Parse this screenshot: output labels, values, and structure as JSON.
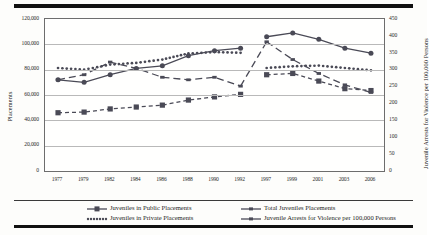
{
  "chart_data": {
    "type": "line",
    "title": "",
    "xlabel": "",
    "ylabel": "Placements",
    "ylabel_right": "Juvenile Arrests for Violence per 100,000 Persons",
    "grid": true,
    "legend_position": "bottom",
    "categories": [
      "1977",
      "1979",
      "1982",
      "1984",
      "1986",
      "1988",
      "1990",
      "1992",
      "1997",
      "1999",
      "2001",
      "2003",
      "2006"
    ],
    "ylim": [
      0,
      120000
    ],
    "yticks": [
      "0",
      "20,000",
      "40,000",
      "60,000",
      "80,000",
      "100,000",
      "120,000"
    ],
    "ylim_right": [
      0,
      450
    ],
    "yticks_right": [
      "0",
      "50",
      "100",
      "150",
      "200",
      "250",
      "300",
      "350",
      "400",
      "450"
    ],
    "series": [
      {
        "name": "Juveniles in Public Placements",
        "axis": "left",
        "values": [
          72000,
          70000,
          76000,
          81000,
          83000,
          91000,
          95000,
          97000,
          106000,
          109000,
          104000,
          97000,
          93000
        ]
      },
      {
        "name": "Juveniles in Private Placements",
        "axis": "left",
        "values": [
          46000,
          46500,
          49000,
          50500,
          52000,
          56000,
          58500,
          60500,
          76000,
          77000,
          71000,
          65000,
          63500
        ]
      },
      {
        "name": "Total Juveniles Placements",
        "axis": "left",
        "values": [
          72000,
          76000,
          86000,
          81000,
          74000,
          72000,
          74000,
          67000,
          102000,
          88000,
          77000,
          68000,
          62000
        ]
      },
      {
        "name": "Juvenile Arrests for Violence per 100,000 Persons",
        "axis": "right",
        "values": [
          305,
          300,
          315,
          320,
          330,
          348,
          352,
          350,
          305,
          310,
          312,
          305,
          298
        ]
      }
    ],
    "legend": [
      {
        "label": "Juveniles in Public Placements",
        "style": "solid-circle"
      },
      {
        "label": "Juveniles in Private Placements",
        "style": "dotted-small"
      },
      {
        "label": "Total Juveniles Placements",
        "style": "solid-line"
      },
      {
        "label": "Juvenile Arrests for Violence per 100,000 Persons",
        "style": "dashed-square"
      }
    ]
  }
}
